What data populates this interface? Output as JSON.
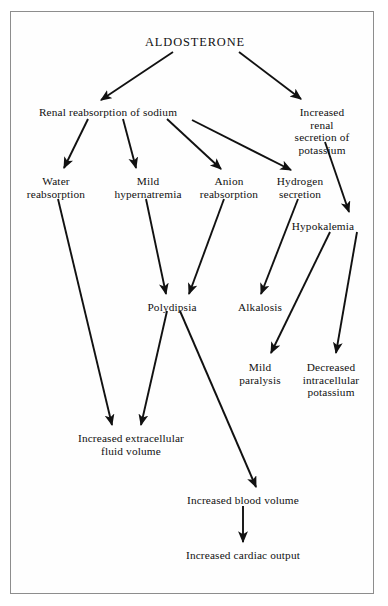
{
  "diagram": {
    "title": "ALDOSTERONE",
    "frame": {
      "stroke": "#8d8d8d"
    },
    "ink": "#111111",
    "nodes": [
      {
        "id": "aldosterone",
        "label": "ALDOSTERONE",
        "x": 195,
        "y": 36,
        "class": "title"
      },
      {
        "id": "renal_na",
        "label": "Renal reabsorption of sodium",
        "x": 108,
        "y": 106,
        "class": ""
      },
      {
        "id": "renal_k",
        "label": "Increased renal\nsecretion of\npotassium",
        "x": 322,
        "y": 106,
        "class": ""
      },
      {
        "id": "water",
        "label": "Water\nreabsorption",
        "x": 56,
        "y": 175,
        "class": ""
      },
      {
        "id": "hypernatremia",
        "label": "Mild\nhypernatremia",
        "x": 148,
        "y": 175,
        "class": ""
      },
      {
        "id": "anion",
        "label": "Anion\nreabsorption",
        "x": 229,
        "y": 175,
        "class": ""
      },
      {
        "id": "hydrogen",
        "label": "Hydrogen\nsecretion",
        "x": 300,
        "y": 175,
        "class": ""
      },
      {
        "id": "hypokalemia",
        "label": "Hypokalemia",
        "x": 323,
        "y": 220,
        "class": ""
      },
      {
        "id": "polydipsia",
        "label": "Polydipsia",
        "x": 172,
        "y": 301,
        "class": ""
      },
      {
        "id": "alkalosis",
        "label": "Alkalosis",
        "x": 260,
        "y": 301,
        "class": ""
      },
      {
        "id": "paralysis",
        "label": "Mild\nparalysis",
        "x": 260,
        "y": 361,
        "class": ""
      },
      {
        "id": "decreased_k",
        "label": "Decreased\nintracellular\npotassium",
        "x": 331,
        "y": 361,
        "class": ""
      },
      {
        "id": "ecf",
        "label": "Increased extracellular\nfluid volume",
        "x": 131,
        "y": 432,
        "class": ""
      },
      {
        "id": "blood_volume",
        "label": "Increased blood volume",
        "x": 243,
        "y": 494,
        "class": ""
      },
      {
        "id": "cardiac",
        "label": "Increased cardiac output",
        "x": 243,
        "y": 549,
        "class": ""
      }
    ],
    "edges": [
      {
        "from": "aldosterone",
        "to": "renal_na",
        "x1": 173,
        "y1": 52,
        "x2": 101,
        "y2": 100
      },
      {
        "from": "aldosterone",
        "to": "renal_k",
        "x1": 239,
        "y1": 52,
        "x2": 301,
        "y2": 99
      },
      {
        "from": "renal_na",
        "to": "water",
        "x1": 88,
        "y1": 119,
        "x2": 64,
        "y2": 168
      },
      {
        "from": "renal_na",
        "to": "hypernatremia",
        "x1": 123,
        "y1": 119,
        "x2": 136,
        "y2": 168
      },
      {
        "from": "renal_na",
        "to": "anion",
        "x1": 167,
        "y1": 119,
        "x2": 221,
        "y2": 169
      },
      {
        "from": "renal_na",
        "to": "hydrogen",
        "x1": 192,
        "y1": 120,
        "x2": 291,
        "y2": 170
      },
      {
        "from": "renal_k",
        "to": "hypokalemia",
        "x1": 325,
        "y1": 142,
        "x2": 349,
        "y2": 212
      },
      {
        "from": "water",
        "to": "ecf",
        "x1": 58,
        "y1": 199,
        "x2": 112,
        "y2": 425
      },
      {
        "from": "hypernatremia",
        "to": "polydipsia",
        "x1": 146,
        "y1": 199,
        "x2": 166,
        "y2": 294
      },
      {
        "from": "anion",
        "to": "polydipsia",
        "x1": 224,
        "y1": 199,
        "x2": 189,
        "y2": 294
      },
      {
        "from": "hydrogen",
        "to": "alkalosis",
        "x1": 298,
        "y1": 199,
        "x2": 261,
        "y2": 294
      },
      {
        "from": "hypokalemia",
        "to": "paralysis",
        "x1": 330,
        "y1": 232,
        "x2": 271,
        "y2": 353
      },
      {
        "from": "hypokalemia",
        "to": "decreased_k",
        "x1": 357,
        "y1": 232,
        "x2": 336,
        "y2": 353
      },
      {
        "from": "polydipsia",
        "to": "ecf",
        "x1": 167,
        "y1": 311,
        "x2": 141,
        "y2": 425
      },
      {
        "from": "polydipsia",
        "to": "blood_volume",
        "x1": 180,
        "y1": 311,
        "x2": 256,
        "y2": 487
      },
      {
        "from": "blood_volume",
        "to": "cardiac",
        "x1": 243,
        "y1": 506,
        "x2": 243,
        "y2": 542
      }
    ]
  }
}
